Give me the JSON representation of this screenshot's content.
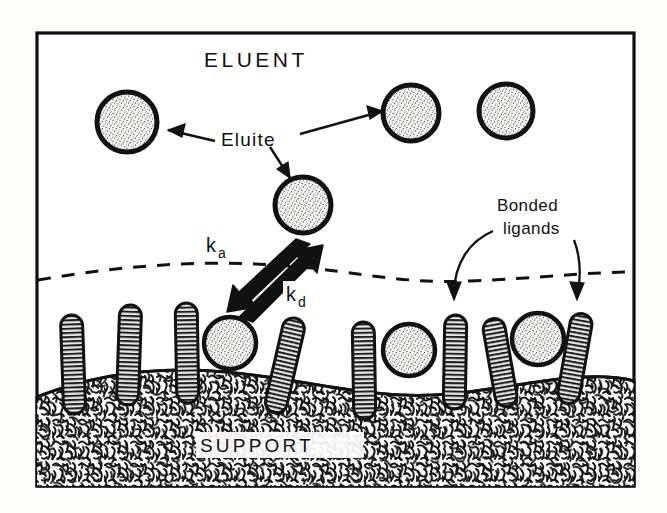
{
  "figure": {
    "kind": "scientific-schematic",
    "frame": {
      "stroke": "#111111",
      "fill": "#ffffff"
    },
    "labels": {
      "eluent": "ELUENT",
      "support": "SUPPORT",
      "eluite": "Eluite",
      "bonded_line1": "Bonded",
      "bonded_line2": "ligands",
      "k_adsorption_base": "k",
      "k_adsorption_sub": "a",
      "k_desorption_base": "k",
      "k_desorption_sub": "d"
    },
    "colors": {
      "ink": "#111111",
      "eluite_fill": "#f2f2f0",
      "ligand_fill": "#d8d8d6",
      "support_fill": "#ffffff",
      "page_background": "#fdfdfc"
    },
    "interface": {
      "style": "dashed",
      "description": "dashed boundary between mobile phase and stationary phase"
    },
    "eluite_particles": [
      {
        "id": "free-upper-left",
        "cx": 127,
        "cy": 122,
        "r": 30,
        "state": "free-in-eluent"
      },
      {
        "id": "free-mid",
        "cx": 303,
        "cy": 205,
        "r": 28,
        "state": "free-in-eluent"
      },
      {
        "id": "free-upper-right",
        "cx": 411,
        "cy": 113,
        "r": 28,
        "state": "free-in-eluent"
      },
      {
        "id": "free-far-right",
        "cx": 506,
        "cy": 111,
        "r": 27,
        "state": "free-in-eluent"
      },
      {
        "id": "bound-left",
        "cx": 230,
        "cy": 343,
        "r": 26,
        "state": "adsorbed-on-ligands"
      },
      {
        "id": "bound-mid",
        "cx": 409,
        "cy": 350,
        "r": 26,
        "state": "adsorbed-on-ligands"
      },
      {
        "id": "bound-right",
        "cx": 538,
        "cy": 339,
        "r": 26,
        "state": "adsorbed-on-ligands"
      }
    ],
    "bonded_ligands": [
      {
        "id": "ligand-1",
        "x": 73,
        "y_top": 315,
        "y_bottom": 412,
        "angle": -2
      },
      {
        "id": "ligand-2",
        "x": 129,
        "y_top": 305,
        "y_bottom": 404,
        "angle": 2
      },
      {
        "id": "ligand-3",
        "x": 187,
        "y_top": 303,
        "y_bottom": 402,
        "angle": -1
      },
      {
        "id": "ligand-4",
        "x": 285,
        "y_top": 317,
        "y_bottom": 413,
        "angle": 12
      },
      {
        "id": "ligand-5",
        "x": 364,
        "y_top": 322,
        "y_bottom": 418,
        "angle": -1
      },
      {
        "id": "ligand-6",
        "x": 455,
        "y_top": 315,
        "y_bottom": 408,
        "angle": 1
      },
      {
        "id": "ligand-7",
        "x": 500,
        "y_top": 318,
        "y_bottom": 406,
        "angle": -9
      },
      {
        "id": "ligand-8",
        "x": 575,
        "y_top": 313,
        "y_bottom": 403,
        "angle": 9
      }
    ],
    "annotation_arrows": [
      {
        "id": "eluite-arrow-left",
        "from": "Eluite label",
        "to": "free-upper-left particle"
      },
      {
        "id": "eluite-arrow-right",
        "from": "Eluite label",
        "to": "free-upper-right particle"
      },
      {
        "id": "eluite-arrow-down",
        "from": "Eluite label",
        "to": "free-mid particle"
      },
      {
        "id": "bonded-arrow-left",
        "from": "Bonded ligands label",
        "to": "ligand-6"
      },
      {
        "id": "bonded-arrow-right",
        "from": "Bonded ligands label",
        "to": "ligand-8"
      }
    ],
    "kinetic_arrows": [
      {
        "id": "k-a-arrow",
        "label": "ka",
        "direction": "down-left",
        "meaning": "adsorption"
      },
      {
        "id": "k-d-arrow",
        "label": "kd",
        "direction": "up-right",
        "meaning": "desorption"
      }
    ]
  }
}
